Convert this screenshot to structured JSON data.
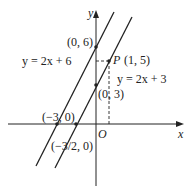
{
  "axes": {
    "x_label": "x",
    "y_label": "y",
    "origin_label": "O"
  },
  "lines": [
    {
      "equation": "y = 2x + 6",
      "x_intercept_label": "(−3, 0)",
      "y_intercept_label": "(0, 6)"
    },
    {
      "equation": "y = 2x + 3",
      "x_intercept_label": "(−3/2, 0)",
      "y_intercept_label": "(0, 3)"
    }
  ],
  "point": {
    "name": "P",
    "coords": "(1, 5)"
  }
}
